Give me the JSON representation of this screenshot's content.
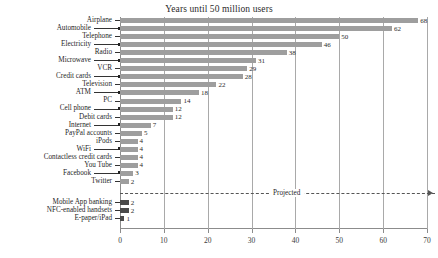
{
  "chart_data": {
    "type": "bar",
    "orientation": "horizontal",
    "title": "Years until 50 million users",
    "xlabel": "",
    "ylabel": "",
    "xlim": [
      0,
      70
    ],
    "xticks": [
      0,
      10,
      20,
      30,
      40,
      50,
      60,
      70
    ],
    "grid": true,
    "legend": "none",
    "bar_color": "#9e9e9e",
    "projected_bar_color": "#4a4a4a",
    "annotations": [
      {
        "text": "Projected",
        "at_x": 38,
        "style": "dashed-separator-with-arrow"
      }
    ],
    "categories": [
      "Airplane",
      "Automobile",
      "Telephone",
      "Electricity",
      "Radio",
      "Microwave",
      "VCR",
      "Credit cards",
      "Television",
      "ATM",
      "PC",
      "Cell phone",
      "Debit cards",
      "Internet",
      "PayPal accounts",
      "iPods",
      "WiFi",
      "Contactless credit cards",
      "You Tube",
      "Facebook",
      "Twitter",
      "Mobile App banking",
      "NFC-enabled handsets",
      "E-paper/iPad"
    ],
    "values": [
      68,
      62,
      50,
      46,
      38,
      31,
      29,
      28,
      22,
      18,
      14,
      12,
      12,
      7,
      5,
      4,
      4,
      4,
      4,
      3,
      2,
      2,
      2,
      1
    ],
    "projected_flags": [
      false,
      false,
      false,
      false,
      false,
      false,
      false,
      false,
      false,
      false,
      false,
      false,
      false,
      false,
      false,
      false,
      false,
      false,
      false,
      false,
      false,
      true,
      true,
      true
    ],
    "label_side": [
      "right",
      "left",
      "right",
      "left",
      "right",
      "left",
      "right",
      "left",
      "right",
      "left",
      "right",
      "left",
      "right",
      "left",
      "right",
      "right",
      "left",
      "right",
      "right",
      "left",
      "right",
      "right",
      "right",
      "right"
    ]
  }
}
